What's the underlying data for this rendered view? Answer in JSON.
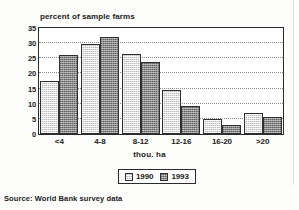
{
  "chart_data": {
    "type": "bar",
    "title": "percent of sample farms",
    "xlabel": "thou. ha",
    "ylabel": "",
    "categories": [
      "<4",
      "4-8",
      "8-12",
      "12-16",
      "16-20",
      ">20"
    ],
    "series": [
      {
        "name": "1990",
        "color": "#bdbdbd",
        "values": [
          17.5,
          29.8,
          26.3,
          14.5,
          5.0,
          7.0
        ]
      },
      {
        "name": "1993",
        "color": "#8a8a8a",
        "values": [
          26.0,
          32.0,
          23.8,
          9.3,
          3.1,
          5.6
        ]
      }
    ],
    "ylim": [
      0,
      35
    ],
    "yticks": [
      0,
      5,
      10,
      15,
      20,
      25,
      30,
      35
    ],
    "ytick_labels": [
      "0",
      "5",
      "10",
      "15",
      "20",
      "25",
      "30",
      "35"
    ],
    "grid": true,
    "grid_axis": "y",
    "legend_position": "bottom-center"
  },
  "legend": {
    "entries": [
      {
        "label": "1990"
      },
      {
        "label": "1993"
      }
    ]
  },
  "source": {
    "note": "Source: World Bank survey data"
  }
}
